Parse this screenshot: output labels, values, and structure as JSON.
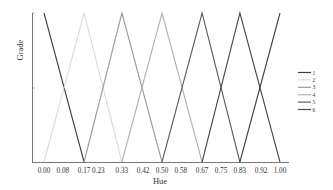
{
  "chart_data": {
    "type": "line",
    "title": "",
    "xlabel": "Hue",
    "ylabel": "Grade",
    "xlim": [
      0,
      1
    ],
    "ylim": [
      0,
      1
    ],
    "grid": false,
    "legend_position": "right",
    "x_ticks": [
      "0.00",
      "0.08",
      "0.17",
      "0.23",
      "0.33",
      "0.42",
      "0.50",
      "0.58",
      "0.67",
      "0.75",
      "0.83",
      "0.92",
      "1.00"
    ],
    "x_tick_values": [
      0.0,
      0.08,
      0.17,
      0.23,
      0.33,
      0.42,
      0.5,
      0.58,
      0.67,
      0.75,
      0.83,
      0.92,
      1.0
    ],
    "series": [
      {
        "name": "1",
        "color": "#3f3f3f",
        "x": [
          0.0,
          0.17
        ],
        "y": [
          1,
          0
        ]
      },
      {
        "name": "2",
        "color": "#dcdcdc",
        "x": [
          0.0,
          0.17,
          0.33
        ],
        "y": [
          0,
          1,
          0
        ]
      },
      {
        "name": "3",
        "color": "#9a9a9a",
        "x": [
          0.17,
          0.33,
          0.5
        ],
        "y": [
          0,
          1,
          0
        ]
      },
      {
        "name": "4",
        "color": "#b0b0b0",
        "x": [
          0.33,
          0.5,
          0.67
        ],
        "y": [
          0,
          1,
          0
        ]
      },
      {
        "name": "5",
        "color": "#5e5e5e",
        "x": [
          0.5,
          0.67,
          0.83
        ],
        "y": [
          0,
          1,
          0
        ]
      },
      {
        "name": "6",
        "color": "#4a4a4a",
        "x": [
          0.67,
          0.83,
          1.0
        ],
        "y": [
          0,
          1,
          0
        ]
      },
      {
        "name": "",
        "color": "#3f3f3f",
        "x": [
          0.83,
          1.0
        ],
        "y": [
          0,
          1
        ]
      }
    ]
  },
  "legend": {
    "items": [
      {
        "label": "1",
        "color": "#3f3f3f"
      },
      {
        "label": "2",
        "color": "#dcdcdc"
      },
      {
        "label": "3",
        "color": "#9a9a9a"
      },
      {
        "label": "4",
        "color": "#b0b0b0"
      },
      {
        "label": "5",
        "color": "#5e5e5e"
      },
      {
        "label": "6",
        "color": "#4a4a4a"
      }
    ]
  }
}
